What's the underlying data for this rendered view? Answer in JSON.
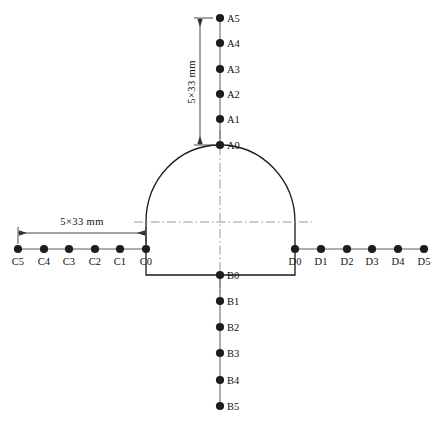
{
  "figure": {
    "background_color": "#ffffff",
    "line_color": "#1a1a1a",
    "marker_color": "#1d1d1d",
    "centerline_color": "#8c8c8c"
  },
  "dimensions": {
    "vertical": {
      "label": "5×33  mm",
      "orientation": "vertical",
      "from_point": "A0",
      "to_point": "A5"
    },
    "horizontal": {
      "label": "5×33  mm",
      "orientation": "horizontal",
      "from_point": "C0",
      "to_point": "C5"
    }
  },
  "arrays": [
    {
      "name": "A",
      "direction": "up",
      "description": "crown array extending upward from tunnel crown",
      "points": [
        {
          "label": "A0",
          "x": 220,
          "y": 145
        },
        {
          "label": "A1",
          "x": 220,
          "y": 119
        },
        {
          "label": "A2",
          "x": 220,
          "y": 94
        },
        {
          "label": "A3",
          "x": 220,
          "y": 69
        },
        {
          "label": "A4",
          "x": 220,
          "y": 43
        },
        {
          "label": "A5",
          "x": 220,
          "y": 18
        }
      ]
    },
    {
      "name": "B",
      "direction": "down",
      "description": "invert array extending downward from tunnel floor",
      "points": [
        {
          "label": "B0",
          "x": 220,
          "y": 275
        },
        {
          "label": "B1",
          "x": 220,
          "y": 301
        },
        {
          "label": "B2",
          "x": 220,
          "y": 327
        },
        {
          "label": "B3",
          "x": 220,
          "y": 353
        },
        {
          "label": "B4",
          "x": 220,
          "y": 380
        },
        {
          "label": "B5",
          "x": 220,
          "y": 406
        }
      ]
    },
    {
      "name": "C",
      "direction": "left",
      "description": "left sidewall array extending left from tunnel wall",
      "points": [
        {
          "label": "C0",
          "x": 146,
          "y": 249
        },
        {
          "label": "C1",
          "x": 120,
          "y": 249
        },
        {
          "label": "C2",
          "x": 95,
          "y": 249
        },
        {
          "label": "C3",
          "x": 69,
          "y": 249
        },
        {
          "label": "C4",
          "x": 44,
          "y": 249
        },
        {
          "label": "C5",
          "x": 18,
          "y": 249
        }
      ]
    },
    {
      "name": "D",
      "direction": "right",
      "description": "right sidewall array extending right from tunnel wall",
      "points": [
        {
          "label": "D0",
          "x": 295,
          "y": 249
        },
        {
          "label": "D1",
          "x": 321,
          "y": 249
        },
        {
          "label": "D2",
          "x": 347,
          "y": 249
        },
        {
          "label": "D3",
          "x": 372,
          "y": 249
        },
        {
          "label": "D4",
          "x": 398,
          "y": 249
        },
        {
          "label": "D5",
          "x": 424,
          "y": 249
        }
      ]
    }
  ],
  "tunnel": {
    "left_wall_x": 146,
    "right_wall_x": 295,
    "crown_y": 145,
    "spring_line_y": 222,
    "floor_y": 275,
    "shape": "horseshoe"
  }
}
